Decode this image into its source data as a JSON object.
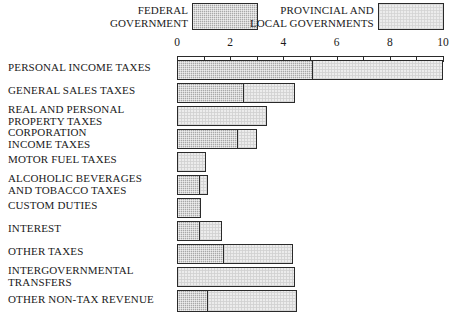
{
  "legend": {
    "federal": {
      "label": "FEDERAL\nGOVERNMENT",
      "swatch": "federal-hatched-swatch",
      "color": "#a8a8a8"
    },
    "provincial": {
      "label": "PROVINCIAL AND\nLOCAL GOVERNMENTS",
      "swatch": "provincial-light-swatch",
      "color": "#ececec"
    }
  },
  "axis": {
    "ticks": [
      "0",
      "2",
      "4",
      "6",
      "8",
      "10"
    ]
  },
  "chart_data": {
    "type": "bar",
    "orientation": "horizontal",
    "stacked": true,
    "title": "",
    "xlabel": "",
    "ylabel": "",
    "xlim": [
      0,
      10
    ],
    "xticks": [
      0,
      2,
      4,
      6,
      8,
      10
    ],
    "grid": false,
    "legend_position": "top",
    "categories": [
      "PERSONAL INCOME TAXES",
      "GENERAL SALES TAXES",
      "REAL AND PERSONAL\nPROPERTY TAXES",
      "CORPORATION\nINCOME TAXES",
      "MOTOR FUEL TAXES",
      "ALCOHOLIC BEVERAGES\nAND TOBACCO TAXES",
      "CUSTOM  DUTIES",
      "INTEREST",
      "OTHER  TAXES",
      "INTERGOVERNMENTAL\nTRANSFERS",
      "OTHER NON-TAX REVENUE"
    ],
    "series": [
      {
        "name": "FEDERAL GOVERNMENT",
        "color": "#a8a8a8",
        "values": [
          5.1,
          2.5,
          0.0,
          2.3,
          0.0,
          0.85,
          0.9,
          0.85,
          1.75,
          0.0,
          1.15
        ]
      },
      {
        "name": "PROVINCIAL AND LOCAL GOVERNMENTS",
        "color": "#ececec",
        "values": [
          4.9,
          1.95,
          3.4,
          0.7,
          1.1,
          0.3,
          0.0,
          0.85,
          2.6,
          4.45,
          3.35
        ]
      }
    ],
    "totals": [
      10.0,
      4.45,
      3.4,
      3.0,
      1.1,
      1.15,
      0.9,
      1.7,
      4.35,
      4.45,
      4.5
    ]
  },
  "rows": [
    {
      "label": "PERSONAL INCOME TAXES",
      "top": 2,
      "h": 20,
      "lt": 4,
      "fed": 5.1,
      "prov": 4.9
    },
    {
      "label": "GENERAL SALES TAXES",
      "top": 25,
      "h": 20,
      "lt": 27,
      "fed": 2.5,
      "prov": 1.95
    },
    {
      "label": "REAL AND PERSONAL\nPROPERTY TAXES",
      "top": 48,
      "h": 20,
      "lt": 46,
      "fed": 0.0,
      "prov": 3.4
    },
    {
      "label": "CORPORATION\nINCOME TAXES",
      "top": 71,
      "h": 20,
      "lt": 69,
      "fed": 2.3,
      "prov": 0.7
    },
    {
      "label": "MOTOR FUEL TAXES",
      "top": 94,
      "h": 20,
      "lt": 96,
      "fed": 0.0,
      "prov": 1.1
    },
    {
      "label": "ALCOHOLIC BEVERAGES\nAND TOBACCO TAXES",
      "top": 117,
      "h": 20,
      "lt": 115,
      "fed": 0.85,
      "prov": 0.3
    },
    {
      "label": "CUSTOM  DUTIES",
      "top": 140,
      "h": 20,
      "lt": 142,
      "fed": 0.9,
      "prov": 0.0
    },
    {
      "label": "INTEREST",
      "top": 163,
      "h": 20,
      "lt": 165,
      "fed": 0.85,
      "prov": 0.85
    },
    {
      "label": "OTHER  TAXES",
      "top": 186,
      "h": 20,
      "lt": 188,
      "fed": 1.75,
      "prov": 2.6
    },
    {
      "label": "INTERGOVERNMENTAL\nTRANSFERS",
      "top": 209,
      "h": 20,
      "lt": 207,
      "fed": 0.0,
      "prov": 4.45
    },
    {
      "label": "OTHER NON-TAX REVENUE",
      "top": 232,
      "h": 22,
      "lt": 236,
      "fed": 1.15,
      "prov": 3.35
    }
  ]
}
